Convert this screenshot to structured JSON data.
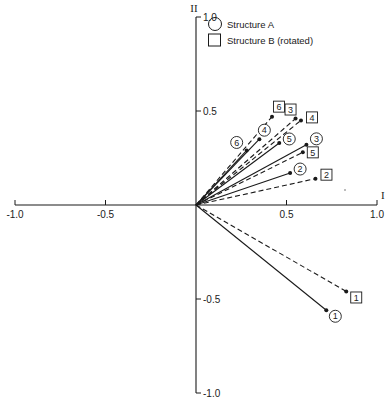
{
  "chart_data": {
    "type": "scatter",
    "subtype": "vector-plot",
    "title": "",
    "xlabel": "I",
    "ylabel": "II",
    "xlim": [
      -1.0,
      1.0
    ],
    "ylim": [
      -1.0,
      1.0
    ],
    "x_ticks": [
      -1.0,
      -0.5,
      0.5,
      1.0
    ],
    "x_tick_labels": [
      "-1.0",
      "-0.5",
      "0.5",
      "1.0"
    ],
    "y_ticks": [
      1.0,
      0.5,
      -0.5,
      -1.0
    ],
    "y_tick_labels": [
      "1.0",
      "0.5",
      "-0.5",
      "-1.0"
    ],
    "grid": false,
    "legend": {
      "position": "upper-center",
      "entries": [
        {
          "marker": "circle",
          "label": "Structure A"
        },
        {
          "marker": "square",
          "label": "Structure B (rotated)"
        }
      ]
    },
    "series": [
      {
        "name": "Structure A",
        "marker": "circle",
        "line_style": "solid",
        "points": [
          {
            "label": "1",
            "x": 0.72,
            "y": -0.56
          },
          {
            "label": "2",
            "x": 0.52,
            "y": 0.17
          },
          {
            "label": "3",
            "x": 0.61,
            "y": 0.32
          },
          {
            "label": "4",
            "x": 0.35,
            "y": 0.35
          },
          {
            "label": "5",
            "x": 0.46,
            "y": 0.33
          },
          {
            "label": "6",
            "x": 0.28,
            "y": 0.29
          }
        ]
      },
      {
        "name": "Structure B (rotated)",
        "marker": "square",
        "line_style": "dashed",
        "points": [
          {
            "label": "1",
            "x": 0.83,
            "y": -0.46
          },
          {
            "label": "2",
            "x": 0.66,
            "y": 0.14
          },
          {
            "label": "3",
            "x": 0.55,
            "y": 0.46
          },
          {
            "label": "4",
            "x": 0.58,
            "y": 0.45
          },
          {
            "label": "5",
            "x": 0.59,
            "y": 0.28
          },
          {
            "label": "6",
            "x": 0.42,
            "y": 0.47
          }
        ]
      }
    ]
  },
  "layout": {
    "origin_px": [
      196,
      205
    ],
    "x_scale_px": 181,
    "y_scale_px": 188,
    "label_offsets": {
      "Structure A": {
        "1": [
          9,
          6
        ],
        "2": [
          10,
          -4
        ],
        "3": [
          10,
          -6
        ],
        "4": [
          5,
          -9
        ],
        "5": [
          10,
          -4
        ],
        "6": [
          -10,
          -8
        ]
      },
      "Structure B (rotated)": {
        "1": [
          10,
          6
        ],
        "2": [
          11,
          -4
        ],
        "3": [
          -5,
          -9
        ],
        "4": [
          11,
          -3
        ],
        "5": [
          10,
          0
        ],
        "6": [
          7,
          -10
        ]
      }
    }
  },
  "colors": {
    "ink": "#1a1a1a",
    "background": "#ffffff"
  }
}
